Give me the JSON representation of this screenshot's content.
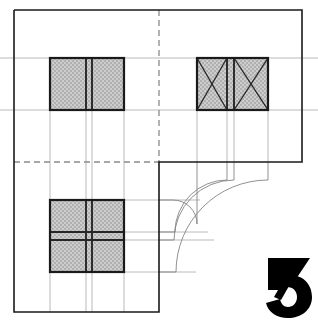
{
  "document": {
    "title": "Architectural Plan Drawing",
    "type": "technical-line-drawing",
    "width": 318,
    "height": 324,
    "background_color": "#ffffff"
  },
  "colors": {
    "heavy_line": "#1a1a1a",
    "medium_line": "#333333",
    "thin_line": "#9a9a9a",
    "construction_line": "#bdbdbd",
    "hatch_fill": "#c8c8c8",
    "hatch_dot": "#9c9c9c",
    "logo_fill": "#000000",
    "page_background": "#ffffff"
  },
  "outline": {
    "name": "L-shaped plan outline",
    "stroke": "#1a1a1a",
    "stroke_width": 1.6,
    "points": "14,10 302,10 302,162 159,162 159,312 14,312 14,10"
  },
  "dashed_lines": [
    {
      "name": "vertical-centerline",
      "orientation": "vertical",
      "x1": 159,
      "y1": 10,
      "x2": 159,
      "y2": 162,
      "stroke": "#8a8a8a",
      "dash": "6 4"
    },
    {
      "name": "horizontal-centerline",
      "orientation": "horizontal",
      "x1": 14,
      "y1": 162,
      "x2": 159,
      "y2": 162,
      "stroke": "#8a8a8a",
      "dash": "6 4"
    }
  ],
  "construction_lines": {
    "horizontal": [
      {
        "name": "upper-projection-line",
        "x1": 0,
        "y1": 58,
        "x2": 318,
        "y2": 58
      },
      {
        "name": "mid-projection-line",
        "x1": 0,
        "y1": 110,
        "x2": 318,
        "y2": 110
      },
      {
        "name": "lower-box-top-line",
        "x1": 50,
        "y1": 200,
        "x2": 200,
        "y2": 200
      },
      {
        "name": "lower-box-mid-line",
        "x1": 14,
        "y1": 232,
        "x2": 205,
        "y2": 232
      },
      {
        "name": "lower-box-mid2-line",
        "x1": 14,
        "y1": 240,
        "x2": 212,
        "y2": 240
      },
      {
        "name": "lower-box-bottom-line",
        "x1": 14,
        "y1": 272,
        "x2": 190,
        "y2": 272
      }
    ],
    "vertical": [
      {
        "name": "left-ext-line-a",
        "x1": 50,
        "y1": 58,
        "x2": 50,
        "y2": 312
      },
      {
        "name": "left-ext-line-b",
        "x1": 86,
        "y1": 58,
        "x2": 86,
        "y2": 312
      },
      {
        "name": "left-ext-line-c",
        "x1": 92,
        "y1": 58,
        "x2": 92,
        "y2": 312
      },
      {
        "name": "left-ext-line-d",
        "x1": 124,
        "y1": 58,
        "x2": 124,
        "y2": 312
      },
      {
        "name": "right-ext-line-a",
        "x1": 197,
        "y1": 58,
        "x2": 197,
        "y2": 162
      },
      {
        "name": "right-ext-line-b",
        "x1": 227,
        "y1": 58,
        "x2": 227,
        "y2": 162
      },
      {
        "name": "right-ext-line-c",
        "x1": 234,
        "y1": 58,
        "x2": 234,
        "y2": 162
      },
      {
        "name": "right-ext-line-d",
        "x1": 268,
        "y1": 58,
        "x2": 268,
        "y2": 162
      }
    ]
  },
  "arcs": [
    {
      "name": "arc-inner",
      "d": "M 159,200 L 175,200 A 36 36 0 0 1 197,228 L 197,162",
      "radius": 36
    },
    {
      "name": "arc-second",
      "d": "M 159,232 L 180,232 A 52 52 0 0 1 227,190 L 227,162",
      "radius": 52
    },
    {
      "name": "arc-third",
      "d": "M 159,240 L 183,240 A 60 60 0 0 1 234,186 L 234,162",
      "radius": 60
    },
    {
      "name": "arc-outer",
      "d": "M 159,272 L 192,272 A 92 92 0 0 1 268,198 L 268,162",
      "radius": 92
    }
  ],
  "hatched_boxes": [
    {
      "name": "top-left-double-panel",
      "label": "double panel unit",
      "x": 50,
      "y": 58,
      "width": 74,
      "height": 52,
      "divisions": "vertical-split",
      "split_x": [
        86,
        92
      ],
      "diagonals": false
    },
    {
      "name": "top-right-double-leaf-window",
      "label": "double leaf with X diagonals",
      "x": 197,
      "y": 58,
      "width": 71,
      "height": 52,
      "divisions": "vertical-split",
      "split_x": [
        227,
        234
      ],
      "diagonals": true
    },
    {
      "name": "bottom-left-quad-panel",
      "label": "four panel grid unit",
      "x": 50,
      "y": 200,
      "width": 74,
      "height": 72,
      "divisions": "quad-split",
      "split_x": [
        86,
        92
      ],
      "split_y": [
        232,
        240
      ],
      "diagonals": false
    }
  ],
  "logo": {
    "name": "numeral-three-logo",
    "text": "3",
    "x": 262,
    "y": 258,
    "width": 50,
    "height": 58,
    "color": "#000000",
    "style": "stylized bold numeral"
  }
}
